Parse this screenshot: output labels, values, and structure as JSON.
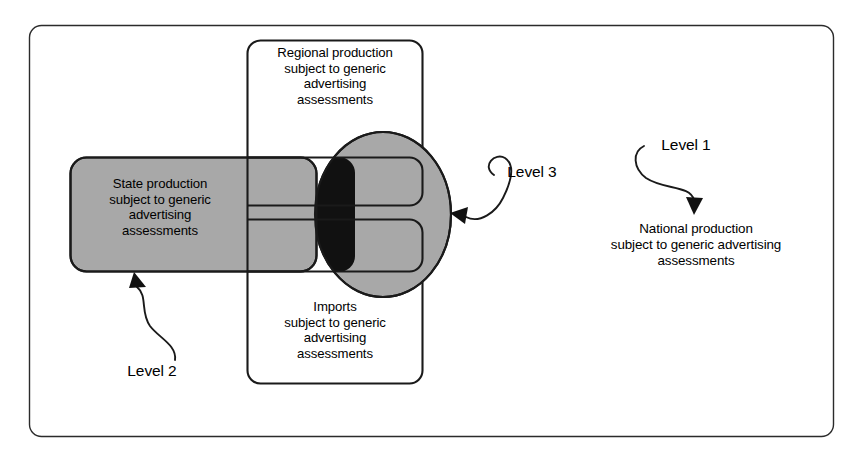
{
  "figure": {
    "type": "venn-overlap-diagram",
    "background_color": "#ffffff",
    "line_color": "#1a1a1a",
    "fill_grey": "#a8a8a8",
    "fill_black": "#111111"
  },
  "frame": {
    "name": "outer-frame"
  },
  "shapes": {
    "regional_box": {
      "label": "Regional production\nsubject to generic\nadvertising\nassessments",
      "fill": "#ffffff"
    },
    "imports_box": {
      "label": "Imports\nsubject to generic\nadvertising\nassessments",
      "fill": "#ffffff"
    },
    "state_box": {
      "label": "State production\nsubject to generic\nadvertising\nassessments",
      "fill": "#a8a8a8"
    },
    "level3_ellipse": {
      "fill": "#a8a8a8"
    },
    "overlap_region": {
      "fill": "#111111"
    }
  },
  "annotations": {
    "level_1": {
      "label": "Level 1",
      "target": "National production text"
    },
    "level_2": {
      "label": "Level 2",
      "target": "State production box"
    },
    "level_3": {
      "label": "Level 3",
      "target": "Level 3 ellipse"
    }
  },
  "national": {
    "label": "National production\nsubject to generic advertising\nassessments"
  }
}
